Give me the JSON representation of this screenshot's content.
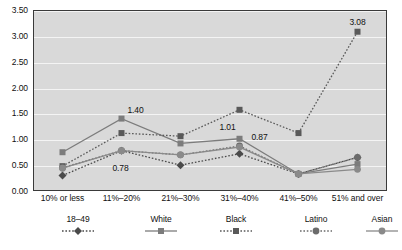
{
  "chart_data": {
    "type": "line",
    "title": "",
    "xlabel": "",
    "ylabel": "",
    "grid": true,
    "legend_position": "bottom",
    "ylim": [
      0.0,
      3.5
    ],
    "ytick_labels": [
      "0.00",
      "0.50",
      "1.00",
      "1.50",
      "2.00",
      "2.50",
      "3.00",
      "3.50"
    ],
    "ytick_values": [
      0.0,
      0.5,
      1.0,
      1.5,
      2.0,
      2.5,
      3.0,
      3.5
    ],
    "categories": [
      "10% or less",
      "11%–20%",
      "21%–30%",
      "31%–40%",
      "41%–50%",
      "51% and over"
    ],
    "series": [
      {
        "name": "18–49",
        "values": [
          0.3,
          0.78,
          0.5,
          0.72,
          0.33,
          0.65
        ],
        "color": "#4a4a4a",
        "marker": "diamond",
        "line": "dotted"
      },
      {
        "name": "White",
        "values": [
          0.75,
          1.4,
          0.92,
          1.01,
          0.33,
          0.52
        ],
        "color": "#7c7c7c",
        "marker": "square",
        "line": "solid"
      },
      {
        "name": "Black",
        "values": [
          0.48,
          1.12,
          1.06,
          1.57,
          1.12,
          3.08
        ],
        "color": "#595959",
        "marker": "square",
        "line": "dotted"
      },
      {
        "name": "Latino",
        "values": [
          0.45,
          0.78,
          0.7,
          0.87,
          0.33,
          0.65
        ],
        "color": "#6b6b6b",
        "marker": "circle",
        "line": "dotted"
      },
      {
        "name": "Asian",
        "values": [
          0.44,
          0.78,
          0.7,
          0.85,
          0.33,
          0.42
        ],
        "color": "#8a8a8a",
        "marker": "circle",
        "line": "solid"
      }
    ],
    "annotations": [
      {
        "text": "1.40",
        "series": "White",
        "category": "11%–20%",
        "value": 1.4,
        "dx": 14,
        "dy": -9
      },
      {
        "text": "0.78",
        "series": "Latino",
        "category": "11%–20%",
        "value": 0.78,
        "dx": -1,
        "dy": 17
      },
      {
        "text": "1.01",
        "series": "White",
        "category": "31%–40%",
        "value": 1.01,
        "dx": -12,
        "dy": -12
      },
      {
        "text": "0.87",
        "series": "Latino",
        "category": "31%–40%",
        "value": 0.87,
        "dx": 20,
        "dy": -9
      },
      {
        "text": "3.08",
        "series": "Black",
        "category": "51% and over",
        "value": 3.08,
        "dx": 0,
        "dy": -10
      }
    ]
  }
}
